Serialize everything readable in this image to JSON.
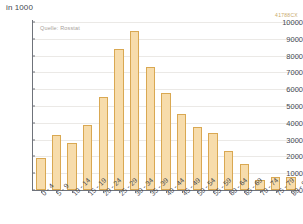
{
  "header": {
    "unit_label": "in 1000",
    "watermark": "41788CX",
    "source_note": "Quelle: Rosstat"
  },
  "chart_data": {
    "type": "bar",
    "title": "",
    "subtitle": "",
    "xlabel": "",
    "ylabel": "in 1000",
    "ylim": [
      0,
      10000
    ],
    "grid": true,
    "legend": false,
    "source": "Quelle: Rosstat",
    "ytick_labels": [
      "0",
      "1000",
      "2000",
      "3000",
      "4000",
      "5000",
      "6000",
      "7000",
      "8000",
      "9000",
      "10000"
    ],
    "yticks": [
      0,
      1000,
      2000,
      3000,
      4000,
      5000,
      6000,
      7000,
      8000,
      9000,
      10000
    ],
    "categories": [
      "0 - 4",
      "5 - 9",
      "10 - 14",
      "15 - 19",
      "20 - 24",
      "25 - 29",
      "30 - 34",
      "35 - 39",
      "40 - 44",
      "45 - 49",
      "50 - 54",
      "55 - 59",
      "60 - 64",
      "65 - 69",
      "70 - 74",
      "75 - 79",
      "80 - 84"
    ],
    "values": [
      1900,
      3300,
      2800,
      3850,
      5550,
      8400,
      9450,
      7350,
      5800,
      4550,
      3750,
      3400,
      2350,
      1550,
      600,
      750,
      750
    ],
    "bar_color": "#f7dcab",
    "bar_border_color": "#d9a852",
    "axis_color": "#6f737a",
    "grid_color": "#ebe9e6",
    "text_color": "#44484f"
  }
}
